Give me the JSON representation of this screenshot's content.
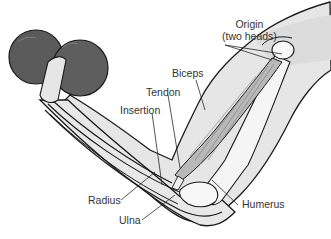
{
  "diagram": {
    "labels": {
      "origin_line1": "Origin",
      "origin_line2": "(two heads)",
      "biceps": "Biceps",
      "tendon": "Tendon",
      "insertion": "Insertion",
      "radius": "Radius",
      "ulna": "Ulna",
      "humerus": "Humerus"
    },
    "colors": {
      "skin": "#e6e6e6",
      "skin_shadow": "#cfcfcf",
      "bone": "#f7f7f7",
      "muscle": "#b9b9b9",
      "dumbbell": "#5a5a5a",
      "outline": "#1a1a1a",
      "text": "#333333"
    }
  }
}
